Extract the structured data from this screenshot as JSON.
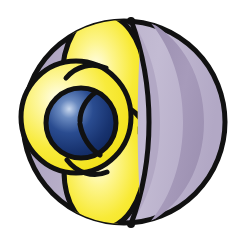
{
  "figure": {
    "name": "sp3-hybrid-orbital-diagram",
    "title": "Hybrid orbital lobes around a central atom within a sphere",
    "background_color": "#ffffff",
    "width": 239,
    "height": 242
  },
  "palette": {
    "outline": "#111111",
    "lobe_yellow_bright": "#F5E617",
    "lobe_yellow_mid": "#F7EB55",
    "lobe_yellow_highlight": "#FFFDE2",
    "sphere_lavender_light": "#C6BFD6",
    "sphere_lavender_mid": "#BAB1CB",
    "sphere_mauve_dark": "#A095B4",
    "nucleus_blue_dark": "#14306B",
    "nucleus_blue_mid": "#1F4083",
    "nucleus_blue_highlight": "#BFD0EA"
  },
  "shapes": {
    "outer_sphere": {
      "label": "cut-away sphere shell",
      "center_x": 124,
      "center_y": 122,
      "radius": 103,
      "fill": "#BAB1CB"
    },
    "shadow_band": {
      "label": "inner shading crescent",
      "fill": "#A095B4"
    },
    "top_lobe": {
      "label": "upper yellow orbital lobe",
      "fill": "#F5E617",
      "highlight_x": 100,
      "highlight_y": 62
    },
    "bottom_lobe": {
      "label": "lower yellow orbital lobe",
      "fill": "#F5E617",
      "highlight_x": 104,
      "highlight_y": 176
    },
    "left_lobe": {
      "label": "left yellow orbital lobe",
      "center_x": 76,
      "center_y": 117,
      "radius_x": 55,
      "radius_y": 56,
      "fill": "#F5E617",
      "highlight_x": 54,
      "highlight_y": 103
    },
    "nucleus": {
      "label": "central nucleus sphere",
      "center_x": 81,
      "center_y": 123,
      "radius": 35,
      "fill": "#14306B",
      "highlight_x": 66,
      "highlight_y": 108
    }
  },
  "labels": {
    "figure_caption": ""
  }
}
